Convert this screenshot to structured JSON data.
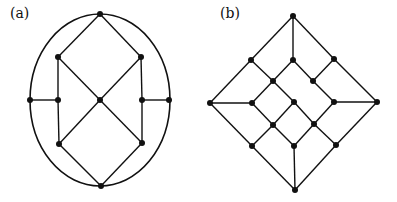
{
  "panels": [
    {
      "label": "(a)",
      "label_pos": [
        10,
        12
      ],
      "nodes": [
        [
          100,
          14
        ],
        [
          58,
          57
        ],
        [
          141,
          57
        ],
        [
          30,
          100
        ],
        [
          58,
          100
        ],
        [
          100,
          100
        ],
        [
          142,
          100
        ],
        [
          169,
          100
        ],
        [
          59,
          144
        ],
        [
          142,
          143
        ],
        [
          101,
          186
        ]
      ],
      "edges": [
        [
          0,
          1
        ],
        [
          0,
          2
        ],
        [
          1,
          4
        ],
        [
          4,
          8
        ],
        [
          2,
          6
        ],
        [
          6,
          9
        ],
        [
          3,
          4
        ],
        [
          6,
          7
        ],
        [
          1,
          5
        ],
        [
          2,
          5
        ],
        [
          5,
          8
        ],
        [
          5,
          9
        ],
        [
          8,
          10
        ],
        [
          9,
          10
        ]
      ],
      "ellipse": {
        "cx": 100,
        "cy": 100,
        "rx": 70,
        "ry": 86
      }
    },
    {
      "label": "(b)",
      "label_pos": [
        220,
        12
      ],
      "nodes": [
        [
          293,
          16
        ],
        [
          251,
          60
        ],
        [
          293,
          60
        ],
        [
          334,
          59
        ],
        [
          273,
          81
        ],
        [
          313,
          81
        ],
        [
          210,
          103
        ],
        [
          252,
          103
        ],
        [
          294,
          102
        ],
        [
          334,
          102
        ],
        [
          377,
          102
        ],
        [
          273,
          125
        ],
        [
          314,
          124
        ],
        [
          252,
          146
        ],
        [
          294,
          146
        ],
        [
          336,
          145
        ],
        [
          295,
          190
        ]
      ],
      "edges": [
        [
          0,
          1
        ],
        [
          0,
          2
        ],
        [
          0,
          3
        ],
        [
          1,
          6
        ],
        [
          3,
          10
        ],
        [
          6,
          13
        ],
        [
          10,
          15
        ],
        [
          13,
          16
        ],
        [
          15,
          16
        ],
        [
          1,
          4
        ],
        [
          4,
          8
        ],
        [
          8,
          12
        ],
        [
          12,
          15
        ],
        [
          2,
          4
        ],
        [
          4,
          7
        ],
        [
          2,
          5
        ],
        [
          5,
          9
        ],
        [
          3,
          5
        ],
        [
          7,
          11
        ],
        [
          11,
          14
        ],
        [
          11,
          8
        ],
        [
          11,
          13
        ],
        [
          12,
          9
        ],
        [
          12,
          14
        ],
        [
          6,
          7
        ],
        [
          9,
          10
        ],
        [
          14,
          16
        ]
      ]
    }
  ]
}
